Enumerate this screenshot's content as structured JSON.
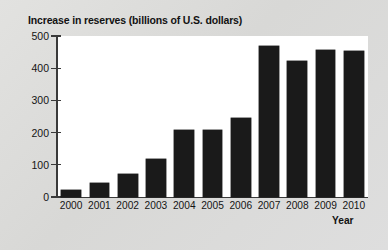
{
  "chart_data": {
    "type": "bar",
    "title": "Increase in reserves (billions of U.S. dollars)",
    "xlabel": "Year",
    "ylabel": "",
    "categories": [
      "2000",
      "2001",
      "2002",
      "2003",
      "2004",
      "2005",
      "2006",
      "2007",
      "2008",
      "2009",
      "2010"
    ],
    "values": [
      22,
      45,
      72,
      117,
      207,
      207,
      245,
      468,
      422,
      458,
      452
    ],
    "ylim": [
      0,
      500
    ],
    "yticks": [
      0,
      100,
      200,
      300,
      400,
      500
    ],
    "ytick_labels": [
      "0",
      "100",
      "200",
      "300",
      "400",
      "500"
    ],
    "grid": false,
    "legend": false,
    "bar_color": "#1a1a1a",
    "plot_background": "#ffffff",
    "figure_background": "#dcdcda"
  }
}
